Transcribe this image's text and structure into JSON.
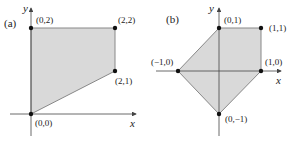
{
  "panels": [
    {
      "id": "a",
      "label": "(a)",
      "x_axis_label": "x",
      "y_axis_label": "y",
      "vertices": [
        {
          "label": "(0,2)",
          "x": 0,
          "y": 2
        },
        {
          "label": "(2,2)",
          "x": 2,
          "y": 2
        },
        {
          "label": "(2,1)",
          "x": 2,
          "y": 1
        },
        {
          "label": "(0,0)",
          "x": 0,
          "y": 0
        }
      ]
    },
    {
      "id": "b",
      "label": "(b)",
      "x_axis_label": "x",
      "y_axis_label": "y",
      "vertices": [
        {
          "label": "(0,1)",
          "x": 0,
          "y": 1
        },
        {
          "label": "(1,1)",
          "x": 1,
          "y": 1
        },
        {
          "label": "(1,0)",
          "x": 1,
          "y": 0
        },
        {
          "label": "(0,−1)",
          "x": 0,
          "y": -1
        },
        {
          "label": "(−1,0)",
          "x": -1,
          "y": 0
        }
      ]
    }
  ],
  "colors": {
    "region_fill": "#d9d9d9",
    "region_stroke": "#888888",
    "axis": "#444444",
    "vertex": "#111111"
  }
}
